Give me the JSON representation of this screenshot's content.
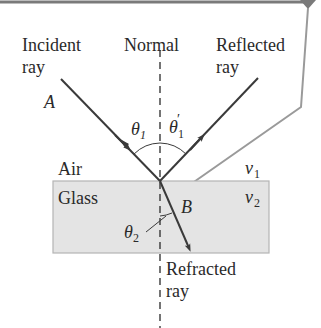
{
  "diagram": {
    "colors": {
      "ray": "#3a3a3a",
      "normal": "#2a2a2a",
      "callout": "#9a9a9a",
      "top_bar": "#7a7a7a",
      "glass_fill": "#e4e4e4",
      "glass_border": "#b4b4b4",
      "text": "#2a2a2a"
    },
    "labels": {
      "incident_line1": "Incident",
      "incident_line2": "ray",
      "normal": "Normal",
      "reflected_line1": "Reflected",
      "reflected_line2": "ray",
      "point_a": "A",
      "point_b": "B",
      "theta1": "θ",
      "theta1_sub": "1",
      "theta1_prime": "θ",
      "theta1_prime_mark": "′",
      "theta1_prime_sub": "1",
      "theta2": "θ",
      "theta2_sub": "2",
      "air": "Air",
      "glass": "Glass",
      "v1": "v",
      "v1_sub": "1",
      "v2": "v",
      "v2_sub": "2",
      "refracted_line1": "Refracted",
      "refracted_line2": "ray"
    },
    "media": [
      {
        "name": "Air",
        "speed_symbol": "v1"
      },
      {
        "name": "Glass",
        "speed_symbol": "v2"
      }
    ],
    "rays": [
      {
        "name": "Incident ray",
        "point": "A",
        "angle": "θ1"
      },
      {
        "name": "Reflected ray",
        "angle": "θ1′"
      },
      {
        "name": "Refracted ray",
        "point": "B",
        "angle": "θ2"
      }
    ]
  }
}
